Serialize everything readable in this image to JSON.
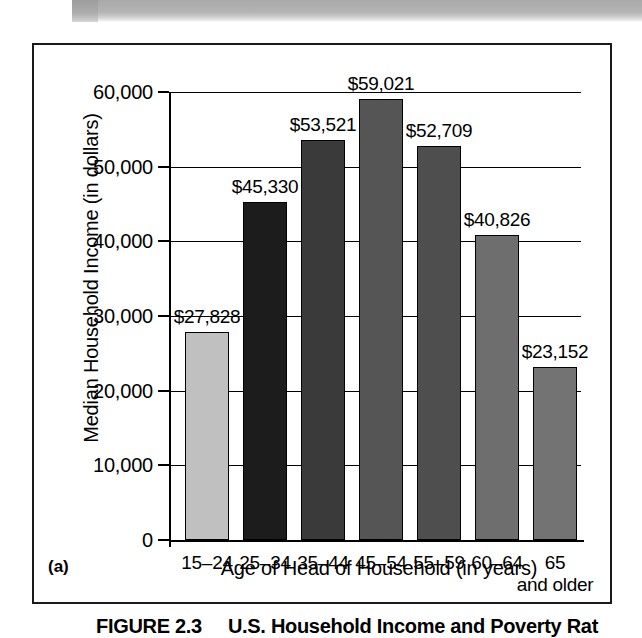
{
  "figure": {
    "panel_label": "(a)",
    "caption_number": "FIGURE 2.3",
    "caption_text": "U.S. Household Income and Poverty Rat"
  },
  "chart_data": {
    "type": "bar",
    "title": "",
    "xlabel": "Age of Head of Household (in years)",
    "ylabel": "Median Household Income (in dollars)",
    "categories": [
      "15–24",
      "25–34",
      "35–44",
      "45–54",
      "55–59",
      "60–64",
      "65"
    ],
    "category_sublabels": [
      "",
      "",
      "",
      "",
      "",
      "",
      "and older"
    ],
    "values": [
      27828,
      45330,
      53521,
      59021,
      52709,
      40826,
      23152
    ],
    "value_labels": [
      "$27,828",
      "$45,330",
      "$53,521",
      "$59,021",
      "$52,709",
      "$40,826",
      "$23,152"
    ],
    "ylim": [
      0,
      60000
    ],
    "ytick_values": [
      0,
      10000,
      20000,
      30000,
      40000,
      50000,
      60000
    ],
    "ytick_labels": [
      "0",
      "10,000",
      "20,000",
      "30,000",
      "40,000",
      "50,000",
      "60,000"
    ],
    "grid": true,
    "grid_axis": "y",
    "legend": "none",
    "bar_colors": [
      "#c0c0c0",
      "#1c1c1c",
      "#3a3a3a",
      "#555555",
      "#4e4e4e",
      "#6e6e6e",
      "#737373"
    ]
  }
}
